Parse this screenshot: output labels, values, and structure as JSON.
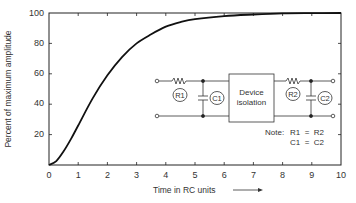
{
  "chart_data": {
    "type": "line",
    "title": "",
    "xlabel": "Time in RC units",
    "ylabel": "Percent of maximum amplitude",
    "xlim": [
      0,
      10
    ],
    "ylim": [
      0,
      100
    ],
    "x_ticks": [
      "0",
      "1",
      "2",
      "3",
      "4",
      "5",
      "6",
      "7",
      "8",
      "9",
      "10"
    ],
    "y_ticks": [
      "20",
      "40",
      "60",
      "80",
      "100"
    ],
    "grid": false,
    "series": [
      {
        "name": "Two-stage RC response",
        "x": [
          0,
          0.25,
          0.5,
          0.75,
          1,
          1.5,
          2,
          2.5,
          3,
          3.5,
          4,
          4.5,
          5,
          6,
          7,
          8,
          9,
          10
        ],
        "values": [
          0,
          2.6,
          9,
          17,
          26,
          44,
          59,
          71,
          80,
          86,
          91,
          94,
          96,
          98,
          99,
          99.7,
          99.9,
          100
        ]
      }
    ],
    "inset": {
      "type": "circuit-diagram",
      "components": [
        "R1",
        "C1",
        "Device isolation",
        "R2",
        "C2"
      ],
      "note_label": "Note:",
      "note_lines": [
        "R1  =  R2",
        "C1  =  C2"
      ]
    }
  },
  "labels": {
    "ylabel": "Percent of maximum amplitude",
    "xlabel": "Time in RC units",
    "x_ticks": [
      "0",
      "1",
      "2",
      "3",
      "4",
      "5",
      "6",
      "7",
      "8",
      "9",
      "10"
    ],
    "y_ticks": [
      "20",
      "40",
      "60",
      "80",
      "100"
    ],
    "r1": "R1",
    "c1": "C1",
    "r2": "R2",
    "c2": "C2",
    "box_line1": "Device",
    "box_line2": "isolation",
    "note": "Note:",
    "note_line1": "R1  =  R2",
    "note_line2": "C1  =  C2"
  }
}
